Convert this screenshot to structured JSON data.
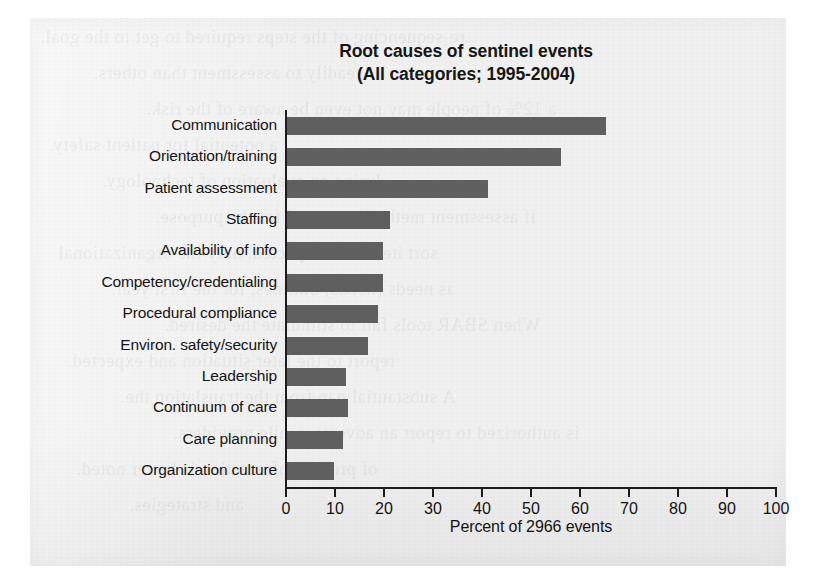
{
  "figure": {
    "bleed_text": [
      "re-sequencing of the steps required to get to the goal.",
      "readily to assessment than others.",
      "a 12% of people may not even be aware of the risk.",
      "a potential for patient safety.",
      "during an evaluation of technology.",
      "if assessment methods are used for the purpose.",
      "sort items. As expected, only the organizational",
      "as needs (needs) outlines, for the first year.",
      "When SBAR tools fail to stimulate the desired.",
      "report to the later situation and expected.",
      "A substantial gap from the translation the.",
      "is authorized to report an adverse, while providers.",
      "of precise information is better noted.",
      "and strategies."
    ]
  },
  "chart_data": {
    "type": "bar",
    "orientation": "horizontal",
    "title": "Root causes of sentinel events",
    "subtitle": "(All categories; 1995-2004)",
    "xlabel": "Percent of 2966 events",
    "ylabel": "",
    "xlim": [
      0,
      100
    ],
    "xticks": [
      0,
      10,
      20,
      30,
      40,
      50,
      60,
      70,
      80,
      90,
      100
    ],
    "grid": false,
    "legend": false,
    "total_events": 2966,
    "bar_color": "#5f5f5f",
    "categories": [
      "Communication",
      "Orientation/training",
      "Patient assessment",
      "Staffing",
      "Availability of info",
      "Competency/credentialing",
      "Procedural compliance",
      "Environ. safety/security",
      "Leadership",
      "Continuum of care",
      "Care planning",
      "Organization culture"
    ],
    "values": [
      65,
      56,
      41,
      21,
      19.5,
      19.5,
      18.5,
      16.5,
      12,
      12.5,
      11.5,
      9.5
    ]
  }
}
